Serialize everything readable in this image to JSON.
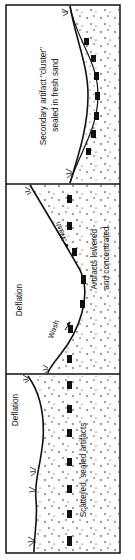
{
  "diagram": {
    "type": "cross-section",
    "orientation": "rotated-90",
    "colors": {
      "ink": "#111111",
      "background": "#ffffff"
    },
    "panels": [
      {
        "id": "top",
        "caption_line1": "Secondary artifact \"cluster\"",
        "caption_line2": "sealed in fresh sand"
      },
      {
        "id": "middle",
        "zone_label": "Deflation",
        "wash_label_upper": "Wash",
        "wash_label_lower": "Wash",
        "caption_line1": "Artifacts lowered",
        "caption_line2": "and concentrated"
      },
      {
        "id": "bottom",
        "zone_label": "Deflation",
        "caption_line1": "Scattered, sealed artifacts"
      }
    ]
  }
}
